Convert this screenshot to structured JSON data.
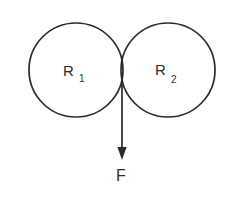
{
  "diagram": {
    "background_color": "#ffffff",
    "stroke_color": "#2a2a2a",
    "left_circle": {
      "label": "R",
      "subscript": "1"
    },
    "right_circle": {
      "label": "R",
      "subscript": "2"
    },
    "force": {
      "label": "F",
      "direction": "down"
    }
  }
}
